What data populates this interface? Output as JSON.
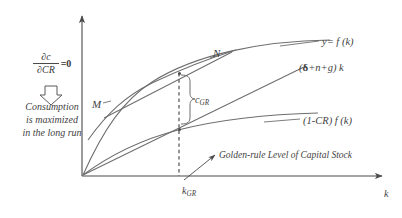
{
  "figure": {
    "axes": {
      "y_axis_name": "vertical-axis",
      "x_axis_label": "k",
      "origin_label": ""
    },
    "curves": [
      {
        "id": "production",
        "label": "y= f  (k)"
      },
      {
        "id": "breakeven",
        "label_prefix": "(",
        "label_delta": "δ",
        "label_suffix": "+n+g) k"
      },
      {
        "id": "investment",
        "label": "(1-CR) f  (k)"
      },
      {
        "id": "tangent-N",
        "label": "N"
      },
      {
        "id": "tangent-M",
        "label": "M"
      }
    ],
    "markers": {
      "consumption_gap": "c",
      "consumption_gap_sub": "GR",
      "capital_stock": "k",
      "capital_stock_sub": "GR"
    },
    "annotations": {
      "golden_rule": "Golden-rule Level of Capital Stock",
      "derivative_numerator": "∂c",
      "derivative_denominator": "∂CR",
      "derivative_equals": "=0",
      "conclusion_line1": "Consumption",
      "conclusion_line2": "is maximized",
      "conclusion_line3": "in the long run"
    },
    "colors": {
      "ink": "#3f3f3f",
      "axis": "#4a4a4a",
      "background": "#ffffff"
    }
  }
}
